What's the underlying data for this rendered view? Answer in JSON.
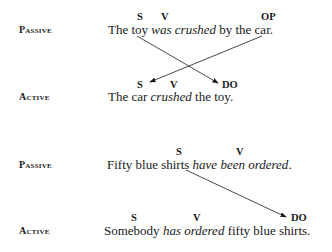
{
  "examples": [
    {
      "passive": {
        "label": "Passive",
        "parts": [
          "The toy ",
          "was crushed",
          " by the car."
        ],
        "tags": {
          "s": "S",
          "v": "V",
          "op": "OP"
        }
      },
      "active": {
        "label": "Active",
        "parts": [
          "The car ",
          "crushed",
          " the toy."
        ],
        "tags": {
          "s": "S",
          "v": "V",
          "do": "DO"
        }
      }
    },
    {
      "passive": {
        "label": "Passive",
        "parts": [
          "Fifty blue shirts ",
          "have been ordered",
          "."
        ],
        "tags": {
          "s": "S",
          "v": "V"
        }
      },
      "active": {
        "label": "Active",
        "parts": [
          "Somebody ",
          "has ordered",
          " fifty blue shirts."
        ],
        "tags": {
          "s": "S",
          "v": "V",
          "do": "DO"
        }
      }
    }
  ],
  "arrows": [
    {
      "from": "passive subject 'toy'",
      "to": "active direct object (DO)"
    },
    {
      "from": "passive object of preposition 'car' (OP)",
      "to": "active subject (S)"
    },
    {
      "from": "passive subject 'shirts'",
      "to": "active direct object (DO)"
    }
  ]
}
